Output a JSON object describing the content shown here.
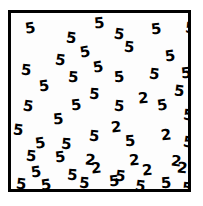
{
  "stimulus": {
    "type": "visual-search-array",
    "target_symbol": "2",
    "distractor_symbol": "5",
    "background_color": "#ffffff",
    "field_color": "#fdfdfd",
    "ink_color": "#000000",
    "border_color": "#000000",
    "border_width_px": 3,
    "total_items": 60,
    "target_count": 9,
    "distractor_count": 51,
    "font_weight": "bold",
    "font_size_px": 15,
    "frame": {
      "x": 8,
      "y": 10,
      "width": 183,
      "height": 182
    },
    "items": [
      {
        "char": "5",
        "x": 14,
        "y": 8,
        "rot": -8
      },
      {
        "char": "5",
        "x": 55,
        "y": 18,
        "rot": 7
      },
      {
        "char": "5",
        "x": 83,
        "y": 3,
        "rot": -5
      },
      {
        "char": "5",
        "x": 103,
        "y": 14,
        "rot": 9
      },
      {
        "char": "5",
        "x": 140,
        "y": 9,
        "rot": -6
      },
      {
        "char": "5",
        "x": 174,
        "y": 8,
        "rot": 5
      },
      {
        "char": "5",
        "x": 69,
        "y": 32,
        "rot": -10
      },
      {
        "char": "5",
        "x": 113,
        "y": 27,
        "rot": 6
      },
      {
        "char": "5",
        "x": 44,
        "y": 40,
        "rot": 8
      },
      {
        "char": "5",
        "x": 154,
        "y": 36,
        "rot": -7
      },
      {
        "char": "5",
        "x": 10,
        "y": 50,
        "rot": 6
      },
      {
        "char": "5",
        "x": 82,
        "y": 47,
        "rot": -9
      },
      {
        "char": "5",
        "x": 57,
        "y": 57,
        "rot": 4
      },
      {
        "char": "5",
        "x": 103,
        "y": 57,
        "rot": -4
      },
      {
        "char": "5",
        "x": 138,
        "y": 54,
        "rot": 8
      },
      {
        "char": "5",
        "x": 170,
        "y": 53,
        "rot": -6
      },
      {
        "char": "5",
        "x": 28,
        "y": 66,
        "rot": -7
      },
      {
        "char": "5",
        "x": 78,
        "y": 74,
        "rot": 5
      },
      {
        "char": "5",
        "x": 163,
        "y": 71,
        "rot": 7
      },
      {
        "char": "2",
        "x": 127,
        "y": 78,
        "rot": -5
      },
      {
        "char": "5",
        "x": 12,
        "y": 86,
        "rot": 9
      },
      {
        "char": "5",
        "x": 60,
        "y": 85,
        "rot": -6
      },
      {
        "char": "5",
        "x": 103,
        "y": 86,
        "rot": 6
      },
      {
        "char": "5",
        "x": 146,
        "y": 85,
        "rot": -8
      },
      {
        "char": "5",
        "x": 172,
        "y": 95,
        "rot": 5
      },
      {
        "char": "5",
        "x": 42,
        "y": 99,
        "rot": -5
      },
      {
        "char": "5",
        "x": 2,
        "y": 110,
        "rot": 7
      },
      {
        "char": "2",
        "x": 100,
        "y": 107,
        "rot": -6
      },
      {
        "char": "5",
        "x": 78,
        "y": 116,
        "rot": 6
      },
      {
        "char": "2",
        "x": 150,
        "y": 115,
        "rot": -7
      },
      {
        "char": "5",
        "x": 24,
        "y": 123,
        "rot": -8
      },
      {
        "char": "5",
        "x": 50,
        "y": 124,
        "rot": 5
      },
      {
        "char": "5",
        "x": 114,
        "y": 121,
        "rot": -4
      },
      {
        "char": "5",
        "x": 172,
        "y": 122,
        "rot": 8
      },
      {
        "char": "5",
        "x": 15,
        "y": 136,
        "rot": 6
      },
      {
        "char": "5",
        "x": 44,
        "y": 137,
        "rot": -6
      },
      {
        "char": "2",
        "x": 74,
        "y": 140,
        "rot": 7
      },
      {
        "char": "2",
        "x": 118,
        "y": 140,
        "rot": -5
      },
      {
        "char": "2",
        "x": 160,
        "y": 141,
        "rot": 6
      },
      {
        "char": "5",
        "x": 20,
        "y": 152,
        "rot": -7
      },
      {
        "char": "5",
        "x": 56,
        "y": 155,
        "rot": 5
      },
      {
        "char": "2",
        "x": 80,
        "y": 148,
        "rot": -6
      },
      {
        "char": "5",
        "x": 104,
        "y": 156,
        "rot": 8
      },
      {
        "char": "2",
        "x": 131,
        "y": 150,
        "rot": -5
      },
      {
        "char": "2",
        "x": 166,
        "y": 148,
        "rot": 7
      },
      {
        "char": "5",
        "x": 5,
        "y": 164,
        "rot": 6
      },
      {
        "char": "5",
        "x": 30,
        "y": 165,
        "rot": -7
      },
      {
        "char": "5",
        "x": 68,
        "y": 163,
        "rot": 5
      },
      {
        "char": "5",
        "x": 98,
        "y": 161,
        "rot": -6
      },
      {
        "char": "5",
        "x": 124,
        "y": 166,
        "rot": 8
      },
      {
        "char": "5",
        "x": 150,
        "y": 163,
        "rot": -4
      },
      {
        "char": "5",
        "x": 171,
        "y": 168,
        "rot": 6
      }
    ]
  }
}
